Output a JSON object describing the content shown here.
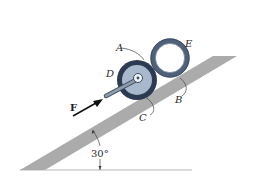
{
  "diagram": {
    "type": "mechanics-free-body",
    "labels": {
      "A": "A",
      "B": "B",
      "C": "C",
      "D": "D",
      "E": "E",
      "F": "F"
    },
    "angle_label": "30°",
    "colors": {
      "ramp": "#a9a9a9",
      "ground_line": "#b0b0b0",
      "wheel_rim": "#2c3a52",
      "wheel_face": "#a8b8cc",
      "ring": "#5d6f86",
      "handle": "#6f7f92",
      "force_arrow": "#111111"
    }
  }
}
